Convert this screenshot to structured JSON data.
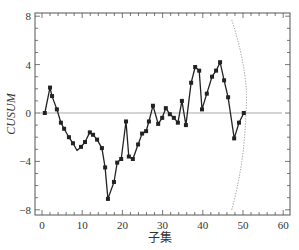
{
  "chart_data": {
    "type": "line",
    "title": "",
    "xlabel": "子集",
    "ylabel": "CUSUM",
    "xlim": [
      -2,
      61
    ],
    "ylim": [
      -8.2,
      8.2
    ],
    "xticks": [
      0,
      10,
      20,
      30,
      40,
      50,
      60
    ],
    "yticks": [
      -8,
      -4,
      0,
      4,
      8
    ],
    "grid": false,
    "legend": null,
    "series": [
      {
        "name": "CUSUM",
        "marker": "square",
        "color": "#222222",
        "x": [
          0.7,
          2.0,
          2.5,
          3.7,
          4.7,
          5.5,
          6.7,
          7.7,
          8.7,
          9.7,
          10.7,
          11.9,
          12.7,
          13.7,
          14.9,
          15.7,
          16.4,
          17.9,
          18.7,
          19.7,
          20.9,
          21.6,
          22.6,
          23.9,
          24.9,
          25.9,
          26.6,
          27.6,
          28.9,
          29.9,
          30.8,
          31.8,
          32.8,
          33.8,
          34.8,
          35.8,
          37.1,
          38.1,
          39.1,
          39.8,
          41.0,
          42.3,
          43.3,
          44.3,
          45.3,
          46.3,
          47.8,
          49.0,
          50.2
        ],
        "y": [
          0.0,
          2.1,
          1.4,
          0.3,
          -0.8,
          -1.3,
          -2.0,
          -2.5,
          -3.1,
          -2.8,
          -2.4,
          -1.6,
          -1.8,
          -2.2,
          -2.9,
          -4.5,
          -7.1,
          -5.7,
          -4.1,
          -3.8,
          -0.7,
          -3.6,
          -3.8,
          -2.6,
          -1.7,
          -1.5,
          -0.7,
          0.6,
          -0.9,
          -0.4,
          0.4,
          -0.1,
          -0.4,
          -0.8,
          1.0,
          -1.0,
          2.5,
          3.8,
          3.5,
          0.3,
          1.6,
          3.0,
          3.5,
          4.2,
          2.7,
          1.3,
          -2.1,
          -0.8,
          0.0
        ],
        "marker_flags": [
          1,
          1,
          1,
          1,
          1,
          1,
          1,
          1,
          0,
          1,
          1,
          1,
          1,
          1,
          1,
          1,
          1,
          1,
          1,
          1,
          1,
          1,
          1,
          1,
          1,
          1,
          1,
          1,
          1,
          1,
          1,
          1,
          1,
          1,
          1,
          1,
          1,
          1,
          1,
          1,
          1,
          1,
          1,
          1,
          1,
          1,
          1,
          1,
          1
        ]
      }
    ],
    "reference_line": {
      "y": 0,
      "color": "#aaaaaa"
    },
    "v_mask": {
      "style": "dotted",
      "color": "#888888",
      "vertex": [
        50.7,
        0
      ],
      "upper_end": [
        47.2,
        7.7
      ],
      "lower_end": [
        47.2,
        -8.0
      ]
    }
  }
}
